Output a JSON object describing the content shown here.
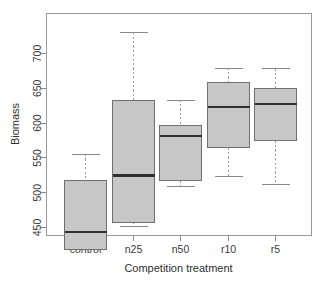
{
  "chart_data": {
    "type": "box",
    "title": "",
    "xlabel": "Competition treatment",
    "ylabel": "Biomass",
    "categories": [
      "control",
      "n25",
      "n50",
      "r10",
      "r5"
    ],
    "ytick_labels": [
      "450",
      "500",
      "550",
      "600",
      "650",
      "700"
    ],
    "ytick_values": [
      450,
      500,
      550,
      600,
      650,
      700
    ],
    "ylim": [
      410,
      740
    ],
    "grid": false,
    "legend": "none",
    "box_fill_color": "#c7c7c7",
    "box_border_color": "#707070",
    "median_color": "#303030",
    "whisker_color": "#9c9c9c",
    "boxes": [
      {
        "category": "control",
        "whisker_low": 417,
        "q1": 417,
        "median": 443,
        "q3": 517,
        "whisker_high": 555
      },
      {
        "category": "n25",
        "whisker_low": 450,
        "q1": 457,
        "median": 524,
        "q3": 632,
        "whisker_high": 730
      },
      {
        "category": "n50",
        "whisker_low": 508,
        "q1": 517,
        "median": 581,
        "q3": 596,
        "whisker_high": 633
      },
      {
        "category": "r10",
        "whisker_low": 522,
        "q1": 564,
        "median": 622,
        "q3": 657,
        "whisker_high": 679
      },
      {
        "category": "r5",
        "whisker_low": 511,
        "q1": 574,
        "median": 627,
        "q3": 649,
        "whisker_high": 678
      }
    ]
  }
}
